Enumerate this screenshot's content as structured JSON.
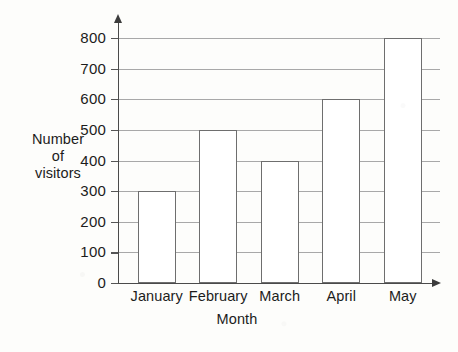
{
  "chart_data": {
    "type": "bar",
    "title": "",
    "categories": [
      "January",
      "February",
      "March",
      "April",
      "May"
    ],
    "values": [
      300,
      500,
      400,
      600,
      800
    ],
    "xlabel": "Month",
    "ylabel": "Number of visitors",
    "ylabel_lines": [
      "Number",
      "of",
      "visitors"
    ],
    "ylim": [
      0,
      800
    ],
    "y_ticks": [
      0,
      100,
      200,
      300,
      400,
      500,
      600,
      700,
      800
    ],
    "y_tick_labels": [
      "0",
      "100",
      "200",
      "300",
      "400",
      "500",
      "600",
      "700",
      "800"
    ],
    "grid": true,
    "grid_axis": "y",
    "legend": false,
    "bar_fill": "#ffffff",
    "bar_edge_color": "#6e6e6e",
    "grid_color": "#a8a8a8",
    "axis_color": "#4a4a4a",
    "background": "#fdfdfb"
  }
}
